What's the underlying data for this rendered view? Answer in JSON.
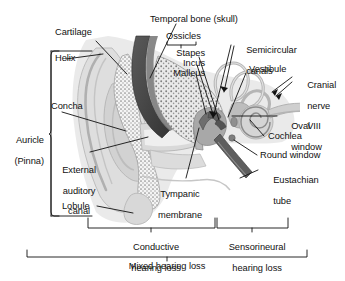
{
  "figure": {
    "type": "anatomical-diagram",
    "background_color": "#ffffff",
    "ink_color": "#111111"
  },
  "labels": {
    "cartilage": "Cartilage",
    "helix": "Helix",
    "concha": "Concha",
    "auricle": "Auricle\n(Pinna)",
    "auricle_line1": "Auricle",
    "auricle_line2": "(Pinna)",
    "external_auditory_canal": "External\nauditory\ncanal",
    "eac_line1": "External",
    "eac_line2": "auditory",
    "eac_line3": "canal",
    "lobule": "Lobule",
    "temporal_bone": "Temporal bone (skull)",
    "ossicles": "Ossicles",
    "stapes": "Stapes",
    "incus": "Incus",
    "malleus": "Malleus",
    "semicircular_canals_line1": "Semicircular",
    "semicircular_canals_line2": "canals",
    "vestibule": "Vestibule",
    "cranial_nerve_line1": "Cranial",
    "cranial_nerve_line2": "nerve",
    "cranial_nerve_line3": "VIII",
    "oval_window_line1": "Oval",
    "oval_window_line2": "window",
    "cochlea": "Cochlea",
    "round_window": "Round window",
    "eustachian_tube_line1": "Eustachian",
    "eustachian_tube_line2": "tube",
    "tympanic_membrane_line1": "Tympanic",
    "tympanic_membrane_line2": "membrane"
  },
  "brackets": {
    "conductive_line1": "Conductive",
    "conductive_line2": "hearing loss",
    "sensorineural_line1": "Sensorineural",
    "sensorineural_line2": "hearing loss",
    "mixed": "Mixed hearing loss"
  },
  "palette": {
    "tissue_light": "#e4e4e4",
    "tissue_mid": "#c9c9c9",
    "tissue_dark": "#9f9f9f",
    "bone_dark": "#4c4c4c",
    "bone_darker": "#3a3a3a",
    "cartilage_fill": "#f2f2f2",
    "stipple": "#8d8d8d",
    "canal_fill": "#d6d6d6",
    "line": "#111111"
  }
}
